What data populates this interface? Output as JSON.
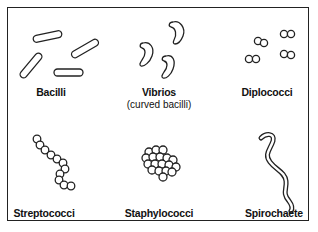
{
  "diagram": {
    "title": "",
    "panels": [
      {
        "id": "bacilli",
        "label": "Bacilli",
        "sublabel": "",
        "shape": "rod"
      },
      {
        "id": "vibrios",
        "label": "Vibrios",
        "sublabel": "(curved bacilli)",
        "shape": "curved-rod"
      },
      {
        "id": "diplococci",
        "label": "Diplococci",
        "sublabel": "",
        "shape": "paired-spheres"
      },
      {
        "id": "streptococci",
        "label": "Streptococci",
        "sublabel": "",
        "shape": "chain-of-spheres"
      },
      {
        "id": "staphylococci",
        "label": "Staphylococci",
        "sublabel": "",
        "shape": "cluster-of-spheres"
      },
      {
        "id": "spirochaete",
        "label": "Spirochaete",
        "sublabel": "",
        "shape": "spiral"
      }
    ],
    "colors": {
      "stroke": "#222222",
      "fill": "#ffffff",
      "text": "#111111"
    }
  }
}
